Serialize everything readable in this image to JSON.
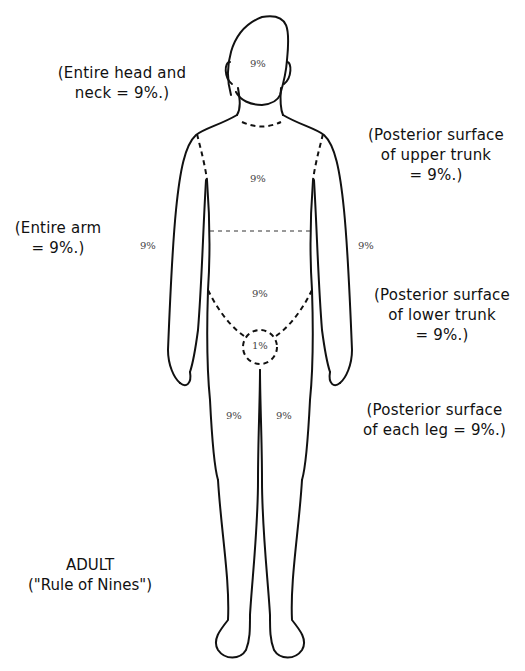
{
  "diagram": {
    "title": "ADULT",
    "subtitle": "(\"Rule of Nines\")",
    "annotations": {
      "head": [
        "(Entire head and",
        "neck = 9%.)"
      ],
      "upper_trunk": [
        "(Posterior surface",
        "of upper trunk",
        "= 9%.)"
      ],
      "arm": [
        "(Entire arm",
        "= 9%.)"
      ],
      "lower_trunk": [
        "(Posterior surface",
        "of lower trunk",
        "= 9%.)"
      ],
      "leg": [
        "(Posterior surface",
        "of each leg = 9%.)"
      ]
    },
    "region_values": {
      "head": "9%",
      "upper_trunk": "9%",
      "left_arm": "9%",
      "right_arm": "9%",
      "lower_trunk": "9%",
      "perineum": "1%",
      "left_leg": "9%",
      "right_leg": "9%"
    },
    "colors": {
      "line": "#111111",
      "background": "#ffffff"
    }
  }
}
